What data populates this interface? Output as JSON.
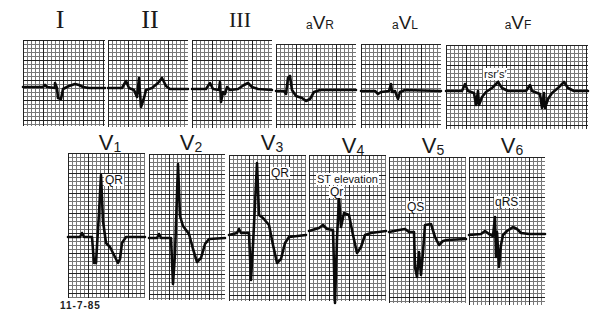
{
  "limb_leads": [
    {
      "id": "I",
      "label": "I",
      "style": "roman"
    },
    {
      "id": "II",
      "label": "II",
      "style": "roman"
    },
    {
      "id": "III",
      "label": "III",
      "style": "roman"
    },
    {
      "id": "aVR",
      "prefix": "a",
      "main": "V",
      "suffix": "R",
      "style": "aug"
    },
    {
      "id": "aVL",
      "prefix": "a",
      "main": "V",
      "suffix": "L",
      "style": "aug"
    },
    {
      "id": "aVF",
      "prefix": "a",
      "main": "V",
      "suffix": "F",
      "style": "aug",
      "annotation": "rsr′s′"
    }
  ],
  "precordial_leads": [
    {
      "id": "V1",
      "main": "V",
      "sub": "1",
      "annotation": "QR"
    },
    {
      "id": "V2",
      "main": "V",
      "sub": "2"
    },
    {
      "id": "V3",
      "main": "V",
      "sub": "3",
      "annotation": "QR"
    },
    {
      "id": "V4",
      "main": "V",
      "sub": "4",
      "annotation": "ST elevation",
      "annotation2": "Qr"
    },
    {
      "id": "V5",
      "main": "V",
      "sub": "5",
      "annotation": "QS"
    },
    {
      "id": "V6",
      "main": "V",
      "sub": "6",
      "annotation": "qRS"
    }
  ],
  "date_label": "11-7-85"
}
